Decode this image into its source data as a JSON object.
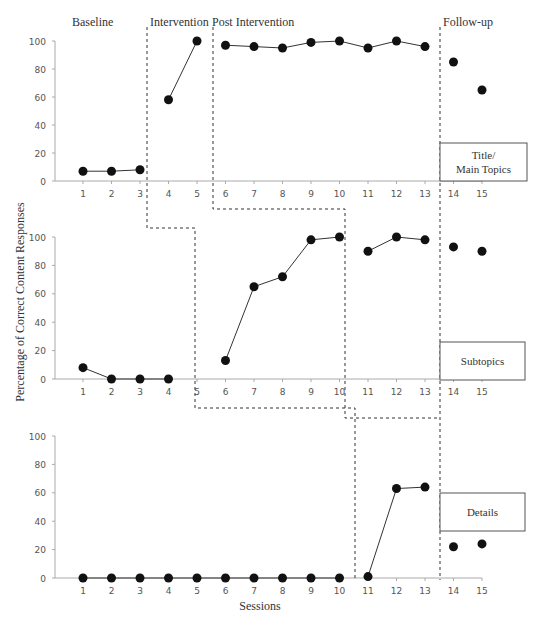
{
  "chart_data": {
    "type": "line",
    "title": "",
    "ylabel": "Percentage of Correct Content Responses",
    "xlabel": "Sessions",
    "ylim": [
      0,
      100
    ],
    "yticks": [
      0,
      20,
      40,
      60,
      80,
      100
    ],
    "x": [
      1,
      2,
      3,
      4,
      5,
      6,
      7,
      8,
      9,
      10,
      11,
      12,
      13,
      14,
      15
    ],
    "grid": false,
    "phase_labels": [
      "Baseline",
      "Intervention",
      "Post Intervention",
      "Follow-up"
    ],
    "panels": [
      {
        "name": "Title/ Main Topics",
        "label_lines": [
          "Title/",
          "Main Topics"
        ],
        "values": [
          7,
          7,
          8,
          58,
          100,
          97,
          96,
          95,
          99,
          100,
          95,
          100,
          96,
          85,
          65
        ],
        "connected_segments": [
          [
            1,
            3
          ],
          [
            4,
            5
          ],
          [
            6,
            13
          ]
        ],
        "phase_change_after": [
          3,
          5,
          13
        ]
      },
      {
        "name": "Subtopics",
        "label_lines": [
          "Subtopics"
        ],
        "values": [
          8,
          0,
          0,
          0,
          null,
          13,
          65,
          72,
          98,
          100,
          90,
          100,
          98,
          93,
          90
        ],
        "connected_segments": [
          [
            1,
            4
          ],
          [
            6,
            10
          ],
          [
            11,
            13
          ]
        ],
        "phase_change_after": [
          5,
          10,
          13
        ]
      },
      {
        "name": "Details",
        "label_lines": [
          "Details"
        ],
        "values": [
          0,
          0,
          0,
          0,
          0,
          0,
          0,
          0,
          0,
          0,
          1,
          63,
          64,
          22,
          24
        ],
        "connected_segments": [
          [
            1,
            10
          ],
          [
            11,
            13
          ]
        ],
        "phase_change_after": [
          10,
          13
        ]
      }
    ]
  }
}
